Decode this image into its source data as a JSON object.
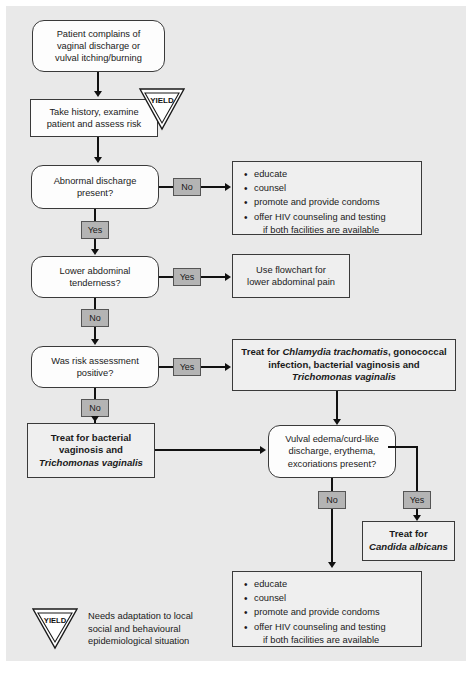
{
  "nodes": {
    "start": "Patient complains of vaginal discharge or vulval itching/burning",
    "start_l1": "Patient complains of",
    "start_l2": "vaginal discharge or",
    "start_l3": "vulval itching/burning",
    "history_l1": "Take history, examine",
    "history_l2": "patient and assess risk",
    "abnormal_l1": "Abnormal discharge",
    "abnormal_l2": "present?",
    "lower_abd_l1": "Lower abdominal",
    "lower_abd_l2": "tenderness?",
    "risk_l1": "Was risk assessment",
    "risk_l2": "positive?",
    "use_flowchart_l1": "Use flowchart for",
    "use_flowchart_l2": "lower abdominal pain",
    "treat_chlamydia_pre": "Treat for ",
    "treat_chlamydia_it1": "Chlamydia trachomatis",
    "treat_chlamydia_mid": ", gonococcal infection, bacterial vaginosis and ",
    "treat_chlamydia_it2": "Trichomonas vaginalis",
    "treat_bv_l1": "Treat for bacterial",
    "treat_bv_l2": "vaginosis and",
    "treat_bv_it": "Trichomonas vaginalis",
    "vulval_l1": "Vulval edema/curd-like",
    "vulval_l2": "discharge, erythema,",
    "vulval_l3": "excoriations present?",
    "treat_candida_l1": "Treat for",
    "treat_candida_it": "Candida albicans"
  },
  "labels": {
    "yes": "Yes",
    "no": "No",
    "abnormal_no": "No",
    "abnormal_yes": "Yes",
    "lower_yes": "Yes",
    "lower_no": "No",
    "risk_yes": "Yes",
    "risk_no": "No",
    "vulval_no": "No",
    "vulval_yes": "Yes"
  },
  "bullets_top": [
    "educate",
    "counsel",
    "promote and provide condoms",
    "offer HIV counseling and testing",
    "if both facilities are available"
  ],
  "bullets_bottom": [
    "educate",
    "counsel",
    "promote and provide condoms",
    "offer HIV counseling and testing",
    "if both facilities are available"
  ],
  "yield": {
    "text": "YIELD",
    "legend_l1": "Needs adaptation to local",
    "legend_l2": "social and behavioural",
    "legend_l3": "epidemiological situation"
  },
  "colors": {
    "background": "#e9e9e9",
    "node_fill": "#fdfdfd",
    "listbox_fill": "#efefef",
    "label_fill": "#b4b4b4",
    "stroke": "#3a3a3a",
    "arrow": "#111111"
  }
}
